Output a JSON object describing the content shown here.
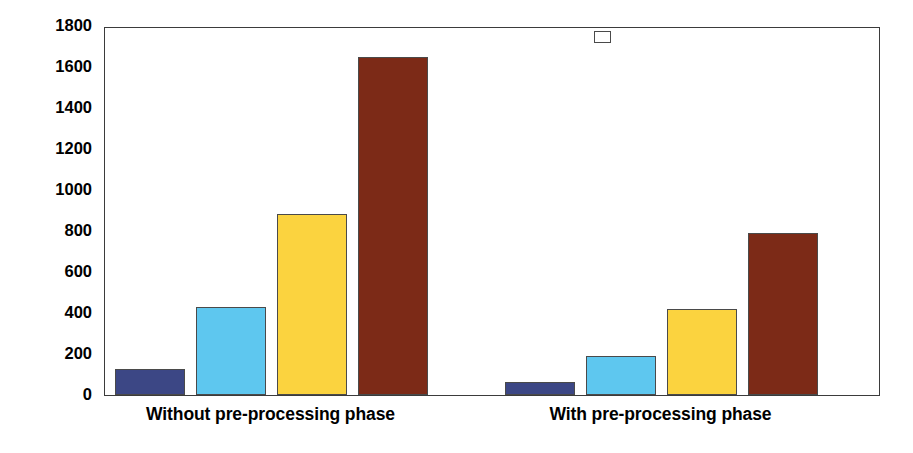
{
  "chart_data": {
    "type": "bar",
    "title": "",
    "xlabel": "",
    "ylabel": "CPU Time [s]",
    "ylim": [
      0,
      1800
    ],
    "ytick_step": 200,
    "yticks": [
      0,
      200,
      400,
      600,
      800,
      1000,
      1200,
      1400,
      1600,
      1800
    ],
    "ytick_labels": [
      "0",
      "200",
      "400",
      "600",
      "800",
      "1000",
      "1200",
      "1400",
      "1600",
      "1800"
    ],
    "categories": [
      "Without pre-processing phase",
      "With pre-processing phase"
    ],
    "grid": false,
    "legend_position": "upper right",
    "series": [
      {
        "name": "Mesh with 1936 triangles",
        "color": "#3c4785",
        "values": [
          127,
          63
        ]
      },
      {
        "name": "Mesh with 7744 triangles",
        "color": "#5ec7ef",
        "values": [
          430,
          190
        ]
      },
      {
        "name": "Mesh with 17424 triangles",
        "color": "#fbd33f",
        "values": [
          883,
          420
        ]
      },
      {
        "name": "Mesh with 30976 triangles",
        "color": "#7c2a17",
        "values": [
          1650,
          792
        ]
      }
    ]
  },
  "legend": {
    "entries": [
      {
        "label": "Mesh with 1936 triangles",
        "color": "#3c4785"
      },
      {
        "label": "Mesh with 7744 triangles",
        "color": "#5ec7ef"
      },
      {
        "label": "Mesh with 17424 triangles",
        "color": "#fbd33f"
      },
      {
        "label": "Mesh with 30976 triangles",
        "color": "#7c2a17"
      }
    ]
  },
  "axes": {
    "y_title": "CPU Time [s]",
    "frame_color": "#3b3b3b"
  }
}
